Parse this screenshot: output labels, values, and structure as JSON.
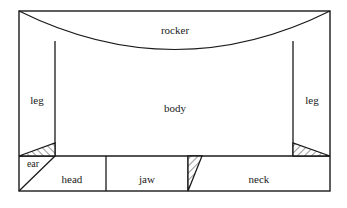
{
  "diagram": {
    "background_color": "#ffffff",
    "line_color": "#1a1a1a",
    "frame": {
      "x": 19,
      "y": 11,
      "width": 311,
      "height": 180
    },
    "labels": {
      "rocker": "rocker",
      "body": "body",
      "leg_left": "leg",
      "leg_right": "leg",
      "ear": "ear",
      "head": "head",
      "jaw": "jaw",
      "neck": "neck"
    },
    "label_positions": {
      "rocker": {
        "x": 175,
        "y": 31
      },
      "body": {
        "x": 175,
        "y": 109
      },
      "leg_left": {
        "x": 37,
        "y": 101
      },
      "leg_right": {
        "x": 312,
        "y": 101
      },
      "ear": {
        "x": 33,
        "y": 165
      },
      "head": {
        "x": 72,
        "y": 180
      },
      "jaw": {
        "x": 147,
        "y": 180
      },
      "neck": {
        "x": 259,
        "y": 180
      }
    },
    "regions": [
      {
        "name": "rocker",
        "label": "rocker",
        "shape": "curved-band"
      },
      {
        "name": "body",
        "label": "body",
        "shape": "polygon"
      },
      {
        "name": "leg-left",
        "label": "leg",
        "shape": "polygon"
      },
      {
        "name": "leg-right",
        "label": "leg",
        "shape": "polygon"
      },
      {
        "name": "ear",
        "label": "ear",
        "shape": "triangle"
      },
      {
        "name": "head",
        "label": "head",
        "shape": "rectangle"
      },
      {
        "name": "jaw",
        "label": "jaw",
        "shape": "rectangle"
      },
      {
        "name": "neck",
        "label": "neck",
        "shape": "rectangle"
      }
    ],
    "hatched_triangles": [
      {
        "name": "hatch-left",
        "points": "19,156 55,156 55,143"
      },
      {
        "name": "hatch-right",
        "points": "330,156 293,156 293,143"
      },
      {
        "name": "hatch-middle",
        "points": "188,156 202,156 188,191"
      }
    ],
    "lines": {
      "divider_y": 156,
      "leg_left_x": 55,
      "leg_right_x": 293,
      "leg_top_y": 41,
      "head_jaw_x": 106,
      "jaw_neck_x": 188,
      "ear_diagonal": "55,156 19,191",
      "rocker_curve": "M 19 11 Q 175 88 330 11"
    }
  }
}
